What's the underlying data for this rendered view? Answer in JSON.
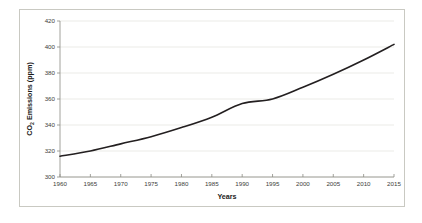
{
  "chart_data": {
    "type": "line",
    "title": "",
    "xlabel": "Years",
    "ylabel": "CO2 Emissions (ppm)",
    "ylabel_prefix": "CO",
    "ylabel_subscript": "2",
    "ylabel_suffix": " Emissions (ppm)",
    "x": [
      1960,
      1965,
      1970,
      1975,
      1980,
      1985,
      1990,
      1995,
      2000,
      2005,
      2010,
      2015
    ],
    "values": [
      316,
      320,
      325.5,
      331,
      338,
      346,
      356.5,
      360,
      369,
      379,
      390,
      402
    ],
    "xtick_labels": [
      "1960",
      "1965",
      "1970",
      "1975",
      "1980",
      "1985",
      "1990",
      "1995",
      "2000",
      "2005",
      "2010",
      "2015"
    ],
    "ytick_labels": [
      "300",
      "320",
      "340",
      "360",
      "380",
      "400",
      "420"
    ],
    "yticks": [
      300,
      320,
      340,
      360,
      380,
      400,
      420
    ],
    "xlim": [
      1960,
      2015
    ],
    "ylim": [
      300,
      420
    ],
    "grid": true,
    "grid_axis": "y",
    "legend": false,
    "series_color": "#231f20",
    "gridline_color": "#e3e3dd",
    "axis_color": "#8c8c84",
    "border_color": "#c9c9c2",
    "background_color": "#ffffff"
  }
}
